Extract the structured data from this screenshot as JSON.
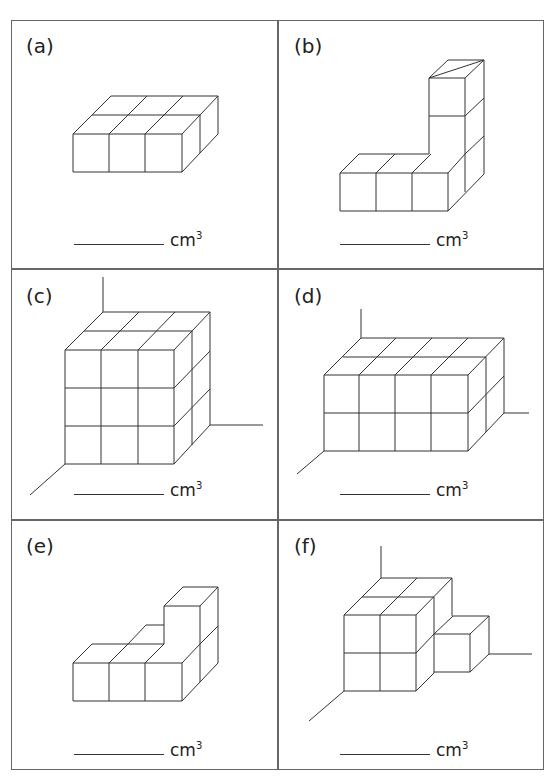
{
  "worksheet": {
    "panels": [
      {
        "id": "a",
        "label": "(a)",
        "unit": "cm",
        "exponent": "3",
        "answer": ""
      },
      {
        "id": "b",
        "label": "(b)",
        "unit": "cm",
        "exponent": "3",
        "answer": ""
      },
      {
        "id": "c",
        "label": "(c)",
        "unit": "cm",
        "exponent": "3",
        "answer": ""
      },
      {
        "id": "d",
        "label": "(d)",
        "unit": "cm",
        "exponent": "3",
        "answer": ""
      },
      {
        "id": "e",
        "label": "(e)",
        "unit": "cm",
        "exponent": "3",
        "answer": ""
      },
      {
        "id": "f",
        "label": "(f)",
        "unit": "cm",
        "exponent": "3",
        "answer": ""
      }
    ]
  }
}
